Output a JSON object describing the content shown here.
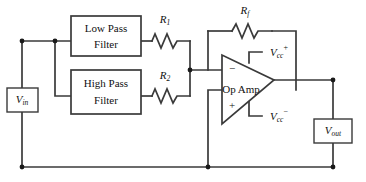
{
  "diagram": {
    "colors": {
      "wire": "#3a3a3a",
      "text": "#111111",
      "background": "#ffffff",
      "node": "#1a1a1a"
    },
    "blocks": {
      "low_pass": {
        "line1": "Low Pass",
        "line2": "Filter"
      },
      "high_pass": {
        "line1": "High Pass",
        "line2": "Filter"
      },
      "op_amp": {
        "label": "Op Amp",
        "inverting_sign": "−",
        "noninverting_sign": "+"
      }
    },
    "resistors": {
      "r1": {
        "symbol": "R",
        "subscript": "1"
      },
      "r2": {
        "symbol": "R",
        "subscript": "2"
      },
      "rf": {
        "symbol": "R",
        "subscript": "f"
      }
    },
    "supplies": {
      "vcc_pos": {
        "symbol": "V",
        "subscript": "cc",
        "superscript": "+"
      },
      "vcc_neg": {
        "symbol": "V",
        "subscript": "cc",
        "superscript": "−"
      }
    },
    "terminals": {
      "vin": {
        "symbol": "V",
        "subscript": "in"
      },
      "vout": {
        "symbol": "V",
        "subscript": "out"
      }
    }
  }
}
